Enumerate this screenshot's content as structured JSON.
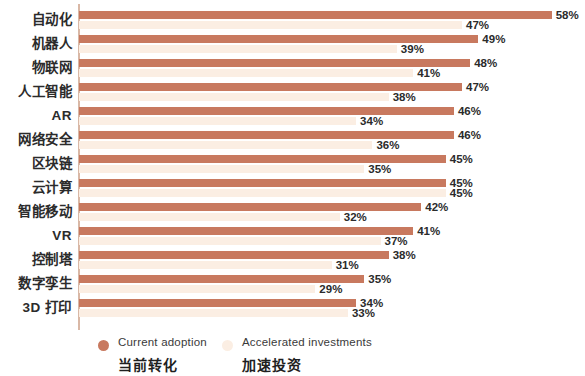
{
  "chart_data": {
    "type": "bar",
    "orientation": "horizontal",
    "title": "",
    "subtitle": "",
    "xlabel": "",
    "ylabel": "",
    "xlim": [
      0,
      58
    ],
    "grid": false,
    "legend_position": "bottom-left",
    "value_suffix": "%",
    "categories": [
      "自动化",
      "机器人",
      "物联网",
      "人工智能",
      "AR",
      "网络安全",
      "区块链",
      "云计算",
      "智能移动",
      "VR",
      "控制塔",
      "数字孪生",
      "3D 打印"
    ],
    "series": [
      {
        "name": "Current adoption",
        "name_zh": "当前转化",
        "color": "#c8795f",
        "values": [
          58,
          49,
          48,
          47,
          46,
          46,
          45,
          45,
          42,
          41,
          38,
          35,
          34
        ],
        "labels": [
          "58%",
          "49%",
          "48%",
          "47%",
          "46%",
          "46%",
          "45%",
          "45%",
          "42%",
          "41%",
          "38%",
          "35%",
          "34%"
        ]
      },
      {
        "name": "Accelerated investments",
        "name_zh": "加速投资",
        "color": "#fbeee3",
        "values": [
          47,
          39,
          41,
          38,
          34,
          36,
          35,
          45,
          32,
          37,
          31,
          29,
          33
        ],
        "labels": [
          "47%",
          "39%",
          "41%",
          "38%",
          "34%",
          "36%",
          "35%",
          "45%",
          "32%",
          "37%",
          "31%",
          "29%",
          "33%"
        ]
      }
    ]
  },
  "legend": {
    "items": [
      {
        "label_en": "Current adoption",
        "label_zh": "当前转化",
        "icon": "circle-marker-current"
      },
      {
        "label_en": "Accelerated investments",
        "label_zh": "加速投资",
        "icon": "circle-marker-accelerated"
      }
    ]
  }
}
